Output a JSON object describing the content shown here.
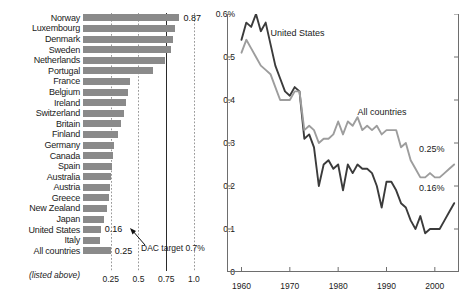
{
  "chart_data": [
    {
      "type": "bar",
      "orientation": "horizontal",
      "title": "",
      "xlabel": "",
      "ylabel": "",
      "xlim": [
        0,
        1.1
      ],
      "grid": true,
      "gridlines": [
        0.25,
        0.5,
        1.0
      ],
      "reference_line": {
        "value": 0.75,
        "style": "solid",
        "label": "DAC target 0.7%"
      },
      "xticks": [
        "0.25",
        "0.5",
        "0.75",
        "1.0"
      ],
      "xtick_values": [
        0.25,
        0.5,
        0.75,
        1.0
      ],
      "categories": [
        "Norway",
        "Luxembourg",
        "Denmark",
        "Sweden",
        "Netherlands",
        "Portugal",
        "France",
        "Belgium",
        "Ireland",
        "Switzerland",
        "Britain",
        "Finland",
        "Germany",
        "Canada",
        "Spain",
        "Australia",
        "Austria",
        "Greece",
        "New Zealand",
        "Japan",
        "United States",
        "Italy",
        "All countries"
      ],
      "values": [
        0.87,
        0.83,
        0.81,
        0.79,
        0.74,
        0.63,
        0.42,
        0.41,
        0.39,
        0.37,
        0.34,
        0.32,
        0.28,
        0.27,
        0.26,
        0.25,
        0.24,
        0.23,
        0.22,
        0.19,
        0.16,
        0.15,
        0.25
      ],
      "data_labels": {
        "Norway": "0.87",
        "United States": "0.16",
        "All countries": "0.25"
      },
      "footnote": "(listed above)",
      "bar_color": "#8a8a8a"
    },
    {
      "type": "line",
      "title": "",
      "xlabel": "",
      "ylabel": "",
      "xlim": [
        1957,
        2005
      ],
      "ylim": [
        0,
        0.6
      ],
      "grid": false,
      "yticks": [
        "0",
        "0.1",
        "0.2",
        "0.3",
        "0.4",
        "0.5",
        "0.6%"
      ],
      "ytick_values": [
        0,
        0.1,
        0.2,
        0.3,
        0.4,
        0.5,
        0.6
      ],
      "xticks": [
        "1960",
        "1970",
        "1980",
        "1990",
        "2000"
      ],
      "xtick_values": [
        1960,
        1970,
        1980,
        1990,
        2000
      ],
      "legend_position": "inline-annotation",
      "annotations": [
        {
          "text": "United States",
          "x": 1966,
          "y": 0.555
        },
        {
          "text": "All countries",
          "x": 1984,
          "y": 0.372
        },
        {
          "text": "0.25%",
          "x": 2002,
          "y": 0.285
        },
        {
          "text": "0.16%",
          "x": 2002,
          "y": 0.196
        }
      ],
      "series": [
        {
          "name": "United States",
          "color": "#3b3b3b",
          "end_label": "0.16%",
          "x": [
            1960,
            1961,
            1962,
            1963,
            1964,
            1965,
            1966,
            1967,
            1968,
            1969,
            1970,
            1971,
            1972,
            1973,
            1974,
            1975,
            1976,
            1977,
            1978,
            1979,
            1980,
            1981,
            1982,
            1983,
            1984,
            1985,
            1986,
            1987,
            1988,
            1989,
            1990,
            1991,
            1992,
            1993,
            1994,
            1995,
            1996,
            1997,
            1998,
            1999,
            2000,
            2001,
            2002,
            2003,
            2004
          ],
          "values": [
            0.54,
            0.58,
            0.57,
            0.6,
            0.56,
            0.58,
            0.53,
            0.48,
            0.45,
            0.42,
            0.41,
            0.43,
            0.42,
            0.31,
            0.32,
            0.29,
            0.2,
            0.25,
            0.26,
            0.24,
            0.25,
            0.19,
            0.25,
            0.23,
            0.25,
            0.24,
            0.24,
            0.23,
            0.2,
            0.15,
            0.21,
            0.21,
            0.19,
            0.16,
            0.15,
            0.12,
            0.1,
            0.13,
            0.09,
            0.1,
            0.1,
            0.1,
            0.12,
            0.14,
            0.16
          ]
        },
        {
          "name": "All countries",
          "color": "#9d9d9d",
          "end_label": "0.25%",
          "x": [
            1960,
            1961,
            1962,
            1963,
            1964,
            1965,
            1966,
            1967,
            1968,
            1969,
            1970,
            1971,
            1972,
            1973,
            1974,
            1975,
            1976,
            1977,
            1978,
            1979,
            1980,
            1981,
            1982,
            1983,
            1984,
            1985,
            1986,
            1987,
            1988,
            1989,
            1990,
            1991,
            1992,
            1993,
            1994,
            1995,
            1996,
            1997,
            1998,
            1999,
            2000,
            2001,
            2002,
            2003,
            2004
          ],
          "values": [
            0.51,
            0.54,
            0.52,
            0.5,
            0.48,
            0.47,
            0.46,
            0.43,
            0.4,
            0.4,
            0.4,
            0.42,
            0.42,
            0.33,
            0.34,
            0.33,
            0.3,
            0.31,
            0.31,
            0.32,
            0.35,
            0.32,
            0.35,
            0.34,
            0.36,
            0.33,
            0.34,
            0.33,
            0.34,
            0.32,
            0.33,
            0.33,
            0.33,
            0.29,
            0.3,
            0.26,
            0.24,
            0.22,
            0.22,
            0.23,
            0.22,
            0.22,
            0.23,
            0.24,
            0.25
          ]
        }
      ]
    }
  ],
  "bar_chart_ui": {
    "dac_note": "DAC target 0.7%",
    "footnote": "(listed above)"
  }
}
